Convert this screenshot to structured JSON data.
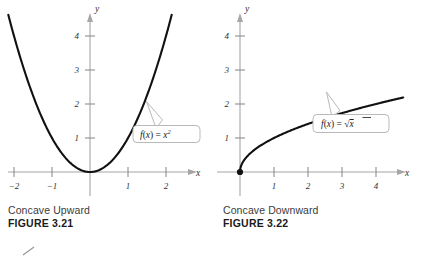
{
  "figures": [
    {
      "id": "figure-3-21",
      "caption_text": "Concave Upward",
      "caption_figure": "FIGURE 3.21",
      "callout": {
        "prefix": "f",
        "open": "(",
        "variable": "x",
        "close": ")",
        "equals": " = ",
        "base": "x",
        "exponent": "2",
        "full": "f(x) = x²"
      },
      "axis": {
        "x_name": "x",
        "y_name": "y"
      },
      "x_ticks": [
        "−2",
        "−1",
        "1",
        "2"
      ],
      "y_ticks": [
        "1",
        "2",
        "3",
        "4"
      ]
    },
    {
      "id": "figure-3-22",
      "caption_text": "Concave Downward",
      "caption_figure": "FIGURE 3.22",
      "callout": {
        "prefix": "f",
        "open": "(",
        "variable": "x",
        "close": ")",
        "equals": " = ",
        "radical": "√",
        "radicand": "x",
        "full": "f(x) = √x"
      },
      "axis": {
        "x_name": "x",
        "y_name": "y"
      },
      "x_ticks": [
        "1",
        "2",
        "3",
        "4"
      ],
      "y_ticks": [
        "1",
        "2",
        "3",
        "4"
      ]
    }
  ],
  "colors": {
    "curve": "#111111",
    "axis": "#a6a6a6",
    "callout_border": "#b9b9b9",
    "caption": "#3b3b3b",
    "background": "#ffffff"
  },
  "chart_data": [
    {
      "type": "line",
      "title": "Concave Upward",
      "subtitle": "FIGURE 3.21",
      "function": "f(x) = x^2",
      "xlabel": "x",
      "ylabel": "y",
      "xlim": [
        -2.3,
        2.3
      ],
      "ylim": [
        -0.35,
        4.8
      ],
      "xticks": [
        -2,
        -1,
        1,
        2
      ],
      "yticks": [
        1,
        2,
        3,
        4
      ],
      "grid": false,
      "legend": "none",
      "annotations": [
        {
          "text": "f(x) = x²",
          "points_to_x": 1.45,
          "points_to_y": 2.1
        }
      ],
      "series": [
        {
          "name": "f(x) = x^2",
          "x": [
            -2.15,
            -2.0,
            -1.75,
            -1.5,
            -1.25,
            -1.0,
            -0.75,
            -0.5,
            -0.25,
            0.0,
            0.25,
            0.5,
            0.75,
            1.0,
            1.25,
            1.5,
            1.75,
            2.0,
            2.15
          ],
          "y": [
            4.62,
            4.0,
            3.06,
            2.25,
            1.56,
            1.0,
            0.56,
            0.25,
            0.06,
            0.0,
            0.06,
            0.25,
            0.56,
            1.0,
            1.56,
            2.25,
            3.06,
            4.0,
            4.62
          ]
        }
      ]
    },
    {
      "type": "line",
      "title": "Concave Downward",
      "subtitle": "FIGURE 3.22",
      "function": "f(x) = sqrt(x)",
      "xlabel": "x",
      "ylabel": "y",
      "xlim": [
        -0.55,
        5.0
      ],
      "ylim": [
        -0.35,
        4.8
      ],
      "xticks": [
        1,
        2,
        3,
        4
      ],
      "yticks": [
        1,
        2,
        3,
        4
      ],
      "grid": false,
      "legend": "none",
      "annotations": [
        {
          "text": "f(x) = √x",
          "points_to_x": 2.55,
          "points_to_y": 1.6
        }
      ],
      "markers": [
        {
          "x": 0,
          "y": 0,
          "style": "filled-circle"
        }
      ],
      "series": [
        {
          "name": "f(x) = sqrt(x)",
          "x": [
            0.0,
            0.05,
            0.15,
            0.3,
            0.5,
            0.75,
            1.0,
            1.5,
            2.0,
            2.5,
            3.0,
            3.5,
            4.0,
            4.5,
            4.8
          ],
          "y": [
            0.0,
            0.224,
            0.387,
            0.548,
            0.707,
            0.866,
            1.0,
            1.225,
            1.414,
            1.581,
            1.732,
            1.871,
            2.0,
            2.121,
            2.191
          ]
        }
      ]
    }
  ]
}
